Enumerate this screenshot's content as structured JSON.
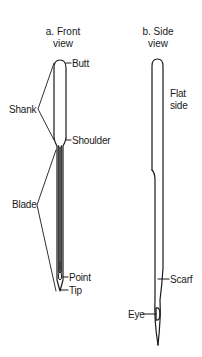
{
  "front_view": {
    "title_line1": "a. Front",
    "title_line2": "view",
    "labels": {
      "butt": "Butt",
      "shank": "Shank",
      "shoulder": "Shoulder",
      "blade": "Blade",
      "point": "Point",
      "tip": "Tip"
    }
  },
  "side_view": {
    "title_line1": "b. Side",
    "title_line2": "view",
    "labels": {
      "flat_side_line1": "Flat",
      "flat_side_line2": "side",
      "scarf": "Scarf",
      "eye": "Eye"
    }
  },
  "colors": {
    "stroke": "#1a1a1a",
    "background": "#ffffff"
  }
}
